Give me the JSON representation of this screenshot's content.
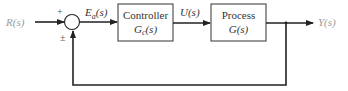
{
  "diagram": {
    "type": "closed-loop feedback control system",
    "input": {
      "label": "R(s)",
      "color": "#9a9a9a"
    },
    "output": {
      "label": "Y(s)",
      "color": "#9a9a9a"
    },
    "summing_junction": {
      "plus_sign": "+",
      "feedback_sign": "±"
    },
    "signals": {
      "error": {
        "base": "E",
        "subscript": "a",
        "arg": "(s)"
      },
      "control": {
        "label": "U(s)"
      }
    },
    "blocks": [
      {
        "title": "Controller",
        "tf_base": "G",
        "tf_subscript": "c",
        "tf_arg": "(s)"
      },
      {
        "title": "Process",
        "tf": "G(s)"
      }
    ],
    "colors": {
      "line": "#222222",
      "text": "#333333",
      "io_text": "#9a9a9a",
      "background": "#ffffff"
    }
  }
}
